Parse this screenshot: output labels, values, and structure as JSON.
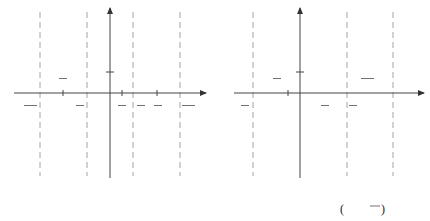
{
  "colors": {
    "curve": "#e0443c",
    "axis": "#444444",
    "asymptote": "#999999",
    "text": "#333333"
  },
  "chart_data": [
    {
      "type": "line",
      "title": "(a) y = tan 2x",
      "function": "y = tan 2x",
      "xlabel": "x",
      "ylabel": "y",
      "asymptotes": [
        "-3π/4",
        "-π/4",
        "π/4",
        "3π/4"
      ],
      "zeros": [
        "-π/2",
        "0",
        "π/2"
      ],
      "x_tick_labels": [
        "-3π/4",
        "-π/2",
        "-π/4",
        "π/8",
        "π/4",
        "π/2",
        "3π/4"
      ],
      "y_tick_labels": [
        "1"
      ],
      "period": "π/2",
      "grid": false
    },
    {
      "type": "line",
      "title": "(b) y = tan 2(x − π/4)",
      "function": "y = tan 2(x - π/4)",
      "xlabel": "x",
      "ylabel": "y",
      "asymptotes": [
        "-π/2",
        "0",
        "π/2",
        "π"
      ],
      "zeros": [
        "-π/4",
        "π/4",
        "3π/4"
      ],
      "x_tick_labels": [
        "-π/2",
        "-π/4",
        "0",
        "π/4",
        "π/2",
        "3π/4",
        "π"
      ],
      "y_tick_labels": [
        "1"
      ],
      "period": "π/2",
      "grid": false
    }
  ],
  "graph_a": {
    "y_axis_label": "y",
    "x_axis_label": "x",
    "y_tick": "1",
    "labels": {
      "neg3pi4_num": "3π",
      "neg3pi4_den": "4",
      "negpi2_num": "π",
      "negpi2_den": "2",
      "negpi4_num": "π",
      "negpi4_den": "4",
      "pi8_num": "π",
      "pi8_den": "8",
      "pi4_num": "π",
      "pi4_den": "4",
      "pi2_num": "π",
      "pi2_den": "2",
      "pi34_num": "3π",
      "pi34_den": "4",
      "minus": "−"
    },
    "caption": "(a)  y = tan 2x"
  },
  "graph_b": {
    "y_axis_label": "y",
    "x_axis_label": "x",
    "y_tick": "1",
    "labels": {
      "negpi2_num": "π",
      "negpi2_den": "2",
      "negpi4_num": "π",
      "negpi4_den": "4",
      "zero": "0",
      "pi4_num": "π",
      "pi4_den": "4",
      "pi2_num": "π",
      "pi2_den": "2",
      "pi34_num": "3π",
      "pi34_den": "4",
      "pi": "π",
      "minus": "−"
    },
    "caption_prefix": "(b)  y = tan 2",
    "caption_x": "x −",
    "caption_num": "π",
    "caption_den": "4"
  }
}
